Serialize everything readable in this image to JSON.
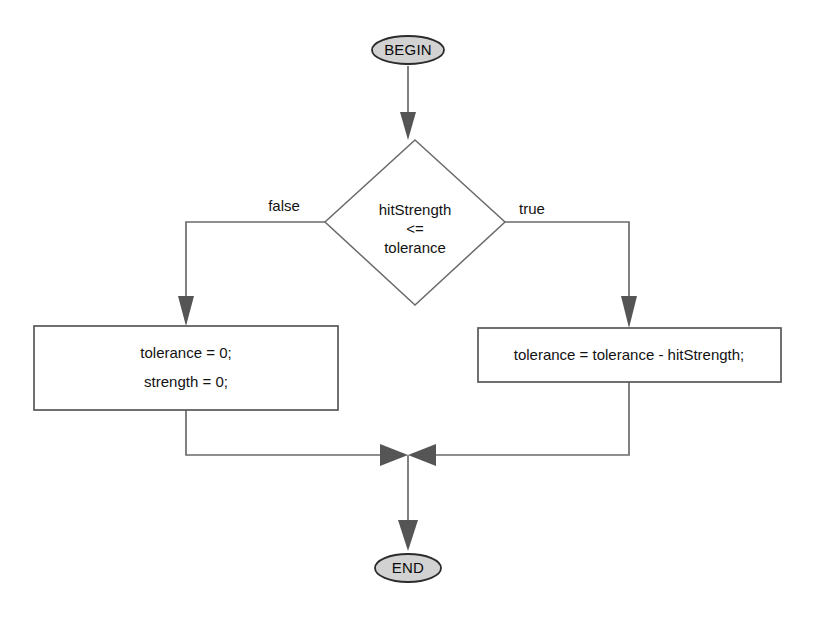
{
  "diagram": {
    "type": "flowchart",
    "title": "",
    "background_color": "#ffffff",
    "terminator_fill": "#d2d2d2",
    "process_fill": "#ffffff",
    "line_color": "#6b6b6b",
    "text_color": "#121212",
    "nodes": {
      "begin": {
        "shape": "ellipse",
        "label": "BEGIN"
      },
      "decision": {
        "shape": "diamond",
        "line1": "hitStrength",
        "line2": "<=",
        "line3": "tolerance"
      },
      "process_false": {
        "shape": "rectangle",
        "line1": "tolerance = 0;",
        "line2": "strength = 0;"
      },
      "process_true": {
        "shape": "rectangle",
        "line1": "tolerance = tolerance - hitStrength;"
      },
      "end": {
        "shape": "ellipse",
        "label": "END"
      }
    },
    "edges": {
      "begin_to_decision": {
        "label": ""
      },
      "decision_false": {
        "label": "false"
      },
      "decision_true": {
        "label": "true"
      },
      "merge_to_end": {
        "label": ""
      }
    }
  }
}
